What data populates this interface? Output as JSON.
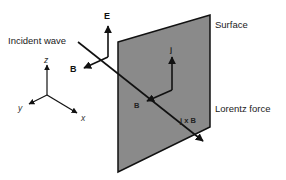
{
  "diagram": {
    "labels": {
      "incident_wave": "Incident wave",
      "surface": "Surface",
      "lorentz_force": "Lorentz force"
    },
    "vectors": {
      "E": "E",
      "B_incident": "B",
      "j": "j",
      "B_surface": "B",
      "j_cross_B": "j x B"
    },
    "axes": {
      "x": "x",
      "y": "y",
      "z": "z"
    },
    "colors": {
      "surface_fill": "#8a8a8a",
      "line": "#111111",
      "background": "#ffffff"
    }
  }
}
